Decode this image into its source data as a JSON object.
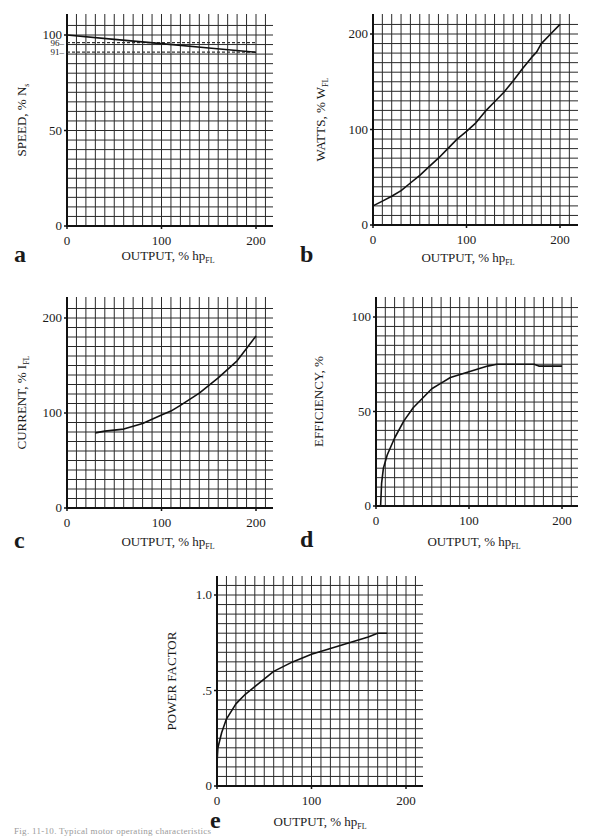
{
  "figure": {
    "caption": "Fig. 11-10. Typical motor operating characteristics",
    "panels": [
      "a",
      "b",
      "c",
      "d",
      "e"
    ]
  },
  "colors": {
    "grid": "#2a2a2a",
    "curve": "#111111",
    "dashed": "#333333",
    "background": "#ffffff"
  },
  "chart_data": [
    {
      "panel": "a",
      "type": "line",
      "title": "",
      "xlabel": "OUTPUT, % hp",
      "xlabel_sub": "FL",
      "ylabel": "SPEED, % N",
      "ylabel_sub": "s",
      "xlim": [
        0,
        215
      ],
      "ylim": [
        0,
        108
      ],
      "xticks": [
        "0",
        "100",
        "200"
      ],
      "yticks": [
        "0",
        "50",
        "100"
      ],
      "annotations": [
        "96",
        "91"
      ],
      "grid": true,
      "x": [
        0,
        50,
        100,
        150,
        200
      ],
      "values": [
        100,
        97.7,
        95.5,
        93.2,
        91
      ],
      "reference_lines": [
        {
          "y": 96,
          "style": "dashed",
          "label": "96"
        },
        {
          "y": 91,
          "style": "dashed",
          "label": "91"
        }
      ]
    },
    {
      "panel": "b",
      "type": "line",
      "xlabel": "OUTPUT, % hp",
      "xlabel_sub": "FL",
      "ylabel": "WATTS, % W",
      "ylabel_sub": "FL",
      "xlim": [
        0,
        215
      ],
      "ylim": [
        0,
        220
      ],
      "xticks": [
        "0",
        "100",
        "200"
      ],
      "yticks": [
        "0",
        "100",
        "200"
      ],
      "grid": true,
      "x": [
        0,
        10,
        20,
        30,
        40,
        50,
        60,
        70,
        80,
        90,
        100,
        110,
        120,
        130,
        140,
        150,
        160,
        170,
        175,
        180,
        190,
        200
      ],
      "values": [
        20,
        25,
        30,
        36,
        44,
        52,
        61,
        70,
        80,
        90,
        98,
        107,
        119,
        129,
        139,
        151,
        164,
        176,
        181,
        190,
        200,
        210
      ]
    },
    {
      "panel": "c",
      "type": "line",
      "xlabel": "OUTPUT, % hp",
      "xlabel_sub": "FL",
      "ylabel": "CURRENT, % I",
      "ylabel_sub": "FL",
      "xlim": [
        0,
        215
      ],
      "ylim": [
        0,
        220
      ],
      "xticks": [
        "0",
        "100",
        "200"
      ],
      "yticks": [
        "0",
        "100",
        "200"
      ],
      "grid": true,
      "x": [
        30,
        40,
        60,
        80,
        100,
        110,
        120,
        140,
        160,
        180,
        190,
        200
      ],
      "values": [
        79,
        81,
        83,
        89,
        98,
        102,
        108,
        121,
        137,
        155,
        168,
        181
      ]
    },
    {
      "panel": "d",
      "type": "line",
      "xlabel": "OUTPUT, % hp",
      "xlabel_sub": "FL",
      "ylabel": "EFFICIENCY, %",
      "xlim": [
        0,
        215
      ],
      "ylim": [
        0,
        108
      ],
      "xticks": [
        "0",
        "100",
        "200"
      ],
      "yticks": [
        "0",
        "50",
        "100"
      ],
      "grid": true,
      "x": [
        5,
        6,
        8,
        12,
        20,
        30,
        40,
        50,
        60,
        70,
        80,
        100,
        120,
        130,
        140,
        170,
        175,
        180,
        200
      ],
      "values": [
        0,
        12,
        20,
        27,
        36,
        45,
        52,
        57,
        62,
        65,
        68,
        71,
        74,
        75,
        75,
        75,
        74,
        74,
        74
      ]
    },
    {
      "panel": "e",
      "type": "line",
      "xlabel": "OUTPUT, % hp",
      "xlabel_sub": "FL",
      "ylabel": "POWER FACTOR",
      "xlim": [
        0,
        215
      ],
      "ylim": [
        0,
        1.1
      ],
      "xticks": [
        "0",
        "100",
        "200"
      ],
      "yticks": [
        "0",
        ".5",
        "1.0"
      ],
      "grid": true,
      "x": [
        0,
        1,
        5,
        10,
        20,
        30,
        40,
        60,
        80,
        100,
        120,
        140,
        160,
        170,
        180
      ],
      "values": [
        0.12,
        0.2,
        0.28,
        0.35,
        0.43,
        0.48,
        0.52,
        0.6,
        0.65,
        0.69,
        0.72,
        0.75,
        0.78,
        0.8,
        0.8
      ]
    }
  ]
}
